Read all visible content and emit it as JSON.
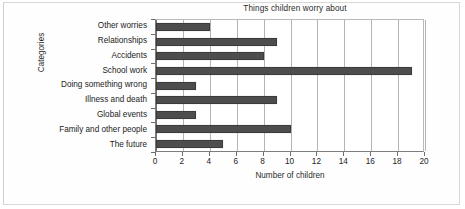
{
  "chart_data": {
    "type": "bar",
    "orientation": "horizontal",
    "title": "Things children worry about",
    "xlabel": "Number of children",
    "ylabel": "Categories",
    "categories": [
      "Other worries",
      "Relationships",
      "Accidents",
      "School work",
      "Doing something wrong",
      "Illness and death",
      "Global events",
      "Family and other people",
      "The future"
    ],
    "values": [
      4,
      9,
      8,
      19,
      3,
      9,
      3,
      10,
      5
    ],
    "xlim": [
      0,
      20
    ],
    "xticks": [
      0,
      2,
      4,
      6,
      8,
      10,
      12,
      14,
      16,
      18,
      20
    ],
    "xtick_labels": [
      "0",
      "2",
      "4",
      "6",
      "8",
      "10",
      "12",
      "14",
      "16",
      "18",
      "20"
    ],
    "grid": true,
    "grid_axis": "x",
    "legend": false,
    "legend_position": "none",
    "bar_color": "#4d4d4d",
    "bar_edge_color": "#3b3b3b",
    "grid_color": "#b4b4b4",
    "axis_color": "#6f6f6f",
    "background_color": "#ffffff",
    "text_color": "#232323"
  }
}
